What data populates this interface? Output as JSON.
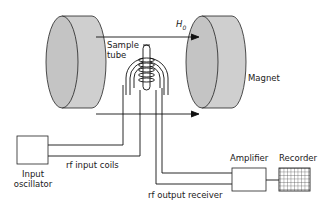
{
  "diagram": {
    "labels": {
      "field": "H",
      "field_sub": "0",
      "sample_tube_line1": "Sample",
      "sample_tube_line2": "tube",
      "magnet": "Magnet",
      "input_oscillator_line1": "Input",
      "input_oscillator_line2": "oscillator",
      "rf_input_coils": "rf input coils",
      "rf_output_receiver": "rf output receiver",
      "amplifier": "Amplifier",
      "recorder": "Recorder"
    },
    "colors": {
      "magnet_fill": "#c8c8c8",
      "magnet_face": "#bdbdbd",
      "line": "#1a1a1a",
      "background": "#ffffff"
    }
  }
}
